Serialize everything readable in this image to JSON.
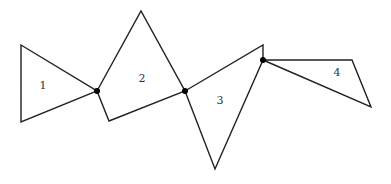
{
  "diagram": {
    "shapes": [
      {
        "id": "1",
        "label": "1",
        "points": "21,45 97,91 21,122",
        "label_pos": [
          43,
          86
        ]
      },
      {
        "id": "2",
        "label": "2",
        "points": "97,91 141,11 185,91 109,121",
        "label_pos": [
          142,
          79
        ]
      },
      {
        "id": "3",
        "label": "3",
        "points": "185,91 263,45 263,60 215,169",
        "label_pos": [
          220,
          101
        ]
      },
      {
        "id": "4",
        "label": "4",
        "points": "263,60 352,60 371,107",
        "label_pos": [
          337,
          73
        ]
      }
    ],
    "joints": [
      {
        "x": 97,
        "y": 91
      },
      {
        "x": 185,
        "y": 91
      },
      {
        "x": 263,
        "y": 60
      }
    ],
    "colors": {
      "stroke": "#222222",
      "joint": "#000000",
      "background": "#ffffff"
    }
  }
}
